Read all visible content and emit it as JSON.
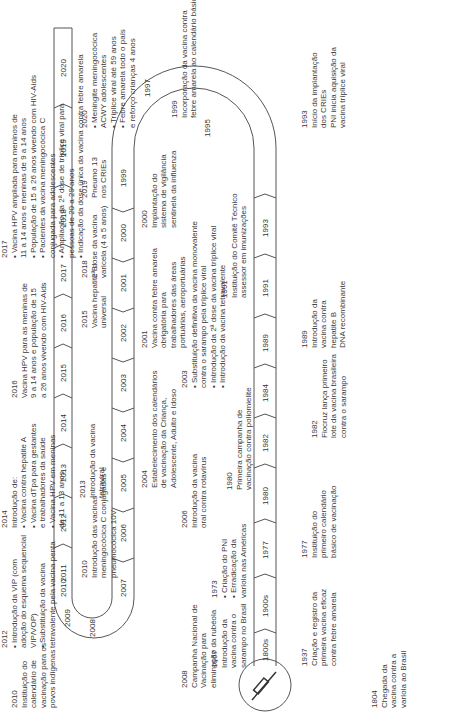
{
  "diagram": {
    "orientation": "rotated-90-ccw",
    "track_segments": {
      "bottom_row": [
        "1800s",
        "1900s",
        "1977",
        "1980",
        "1982",
        "1984",
        "1989",
        "1991",
        "1993"
      ],
      "top_curve": [
        "1995",
        "1997"
      ],
      "middle_row": [
        "1999",
        "2000",
        "2001",
        "2002",
        "2003",
        "2004",
        "2005",
        "2006"
      ],
      "left_curve": [
        "2007",
        "2008",
        "2009",
        "2010"
      ],
      "top_row": [
        "2011",
        "2012",
        "2013",
        "2014",
        "2015",
        "2016",
        "2017",
        "2018",
        "2019",
        "2020"
      ]
    },
    "events": [
      {
        "year": "1804",
        "lines": [
          "Chegada da",
          "vacina contra a",
          "varíola ao Brasil"
        ]
      },
      {
        "year": "1937",
        "lines": [
          "Criação e registro da",
          "primeira vacina eficaz",
          "contra febre amarela"
        ]
      },
      {
        "year": "1967",
        "lines": [
          "Introdução da",
          "vacina contra o",
          "sarampo no Brasil"
        ]
      },
      {
        "year": "1973",
        "lines": [
          "• Criação do PNI",
          "• Erradicação da",
          "varíola nas Américas"
        ]
      },
      {
        "year": "1977",
        "lines": [
          "Instituição do",
          "primeiro calendário",
          "básico de vacinação"
        ]
      },
      {
        "year": "1980",
        "lines": [
          "Primeira campanha de",
          "vacinação contra poliomielite"
        ]
      },
      {
        "year": "1982",
        "lines": [
          "Fiocruz lança primeiro",
          "lote da vacina brasileira",
          "contra o sarampo"
        ]
      },
      {
        "year": "1989",
        "lines": [
          "Introdução da",
          "vacina contra",
          "hepatite B",
          "DNA recombinante"
        ]
      },
      {
        "year": "1991",
        "lines": [
          "Instituição do Comitê Técnico",
          "assessor em imunizações"
        ]
      },
      {
        "year": "1993",
        "lines": [
          "Início da implantação",
          "dos CRIEs",
          "PNI inicia aquisição da",
          "vacina tríplice viral"
        ]
      },
      {
        "year": "1999",
        "lines": [
          "Incorporação da vacina contra",
          "febre amarela ao calendário básico"
        ]
      },
      {
        "year": "2000",
        "lines": [
          "Implantação do",
          "sistema de vigilância",
          "sentinela da influenza"
        ]
      },
      {
        "year": "2001",
        "lines": [
          "Vacina contra febre amarela",
          "obrigatória para",
          "trabalhadores das áreas",
          "portuárias, aeroportuárias"
        ]
      },
      {
        "year": "2003",
        "lines": [
          "• Substituição definitiva da vacina monovalente",
          "contra o sarampo pela tríplice viral",
          "• Introdução da 2ª dose da vacina tríplice viral",
          "• Introdução da vacina tetravalente"
        ]
      },
      {
        "year": "2004",
        "lines": [
          "Estabelecimento dos calendários",
          "de vacinação da Criança,",
          "Adolescente, Adulto e Idoso"
        ]
      },
      {
        "year": "2006",
        "lines": [
          "Introdução da vacina",
          "oral contra rotavírus"
        ]
      },
      {
        "year": "2008",
        "lines": [
          "Campanha Nacional de",
          "Vacinação para",
          "eliminação da rubéola"
        ]
      },
      {
        "year": "2010",
        "lines": [
          "Instituição do",
          "calendário de",
          "vacinação para os",
          "povos indígenas"
        ]
      },
      {
        "year": "2010",
        "lines": [
          "Introdução das vacinas",
          "meningocócica C conjugadas e",
          "pneumocócica 10V"
        ]
      },
      {
        "year": "2012",
        "lines": [
          "• Introdução da VIP (com",
          "adoção do esquema sequencial",
          "VIP/VOP)",
          "• Substituição da vacina",
          "tetravalente pela vacina penta"
        ]
      },
      {
        "year": "2013",
        "lines": [
          "Introdução da vacina",
          "tetraviral"
        ]
      },
      {
        "year": "2014",
        "lines": [
          "Introdução de:",
          "• Vacina contra hepatite A",
          "• Vacina dTpa para gestantes",
          "e trabalhadores da saúde",
          "• Vacina HPV em meninas",
          "de 11 a 13 anos"
        ]
      },
      {
        "year": "2015",
        "lines": [
          "Vacina hepatite B",
          "universal"
        ]
      },
      {
        "year": "2016",
        "lines": [
          "Vacina HPV para as meninas de",
          "9 a 14 anos e população de 15",
          "a 26 anos vivendo com HIV-Aids"
        ]
      },
      {
        "year": "2017",
        "lines": [
          "• Vacina HPV ampliada para meninos de",
          "11 a 14 anos e meninas de 9 a 14 anos",
          "• População de 15 a 26 anos vivendo com HIV-Aids",
          "• Pacientes da vacina meningocócica C",
          "conjugada para adolescentes",
          "• Ampliação da 2ª dose de tríplice viral para",
          "pessoas de 20 a 29 anos",
          "• Indicação da dose única da vacina contra febre amarela"
        ]
      },
      {
        "year": "2018",
        "lines": [
          "2ª dose da vacina",
          "varicela (4 a 5 anos)"
        ]
      },
      {
        "year": "2019",
        "lines": [
          "Pneumo 13",
          "nos CRIEs"
        ]
      },
      {
        "year": "2020",
        "lines": [
          "• Meningite meningocócica",
          "ACWY adolescentes",
          "• Tríplice viral até 59 anos",
          "• Febre amarela todo o país",
          "e reforço crianças 4 anos"
        ]
      }
    ],
    "icon": "syringe-icon",
    "colors": {
      "stroke": "#555555",
      "text": "#3a3a3a",
      "background": "#ffffff"
    }
  }
}
